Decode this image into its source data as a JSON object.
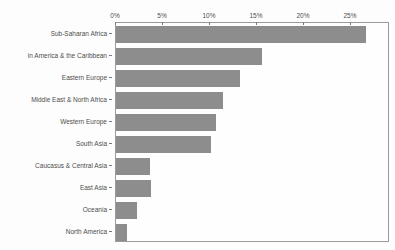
{
  "chart_data": {
    "type": "bar",
    "orientation": "horizontal",
    "title": "",
    "xlabel": "",
    "ylabel": "",
    "unit": "%",
    "categories": [
      "Sub-Saharan Africa",
      "in America & the Caribbean",
      "Eastern Europe",
      "Middle East & North Africa",
      "Western Europe",
      "South Asia",
      "Caucasus & Central Asia",
      "East Asia",
      "Oceania",
      "North America"
    ],
    "values": [
      26.8,
      15.6,
      13.3,
      11.5,
      10.7,
      10.2,
      3.6,
      3.7,
      2.3,
      1.2
    ],
    "x_ticks": [
      "0%",
      "5%",
      "10%",
      "15%",
      "20%",
      "25%"
    ],
    "x_tick_values": [
      0,
      5,
      10,
      15,
      20,
      25
    ],
    "xlim": [
      0,
      29.15
    ],
    "grid": false,
    "legend": "none",
    "axis_position": "top",
    "bar_color": "#8d8d8d",
    "frame_color": "#9b9b9b",
    "tick_color": "#7a7a7a",
    "label_color": "#4d4d4d"
  }
}
